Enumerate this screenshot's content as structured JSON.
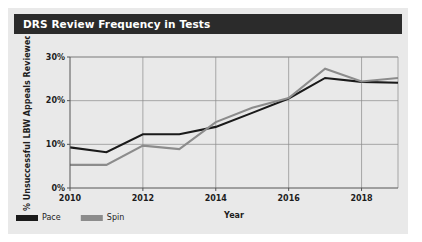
{
  "card": {
    "title": "DRS Review Frequency in Tests",
    "background_color": "#e9e9e9",
    "title_bar_color": "#2b2b2b",
    "title_text_color": "#ffffff"
  },
  "chart_data": {
    "type": "line",
    "title": "DRS Review Frequency in Tests",
    "xlabel": "Year",
    "ylabel": "% Unsuccessful LBW Appeals Reviewed",
    "x": [
      2010,
      2011,
      2012,
      2013,
      2014,
      2015,
      2016,
      2017,
      2018,
      2019
    ],
    "xlim": [
      2010,
      2019
    ],
    "ylim": [
      0,
      30
    ],
    "xticks": [
      2010,
      2012,
      2014,
      2016,
      2018
    ],
    "xtick_labels": [
      "2010",
      "2012",
      "2014",
      "2016",
      "2018"
    ],
    "yticks": [
      0,
      10,
      20,
      30
    ],
    "ytick_labels": [
      "0%",
      "10%",
      "20%",
      "30%"
    ],
    "grid": true,
    "legend_position": "bottom-left",
    "series": [
      {
        "name": "Pace",
        "color": "#1a1a1a",
        "values": [
          9.3,
          8.2,
          12.3,
          12.3,
          14.0,
          17.2,
          20.5,
          25.2,
          24.3,
          24.1
        ]
      },
      {
        "name": "Spin",
        "color": "#8c8c8c",
        "values": [
          5.3,
          5.3,
          9.7,
          8.9,
          15.1,
          18.4,
          20.6,
          27.3,
          24.4,
          25.2
        ]
      }
    ]
  }
}
